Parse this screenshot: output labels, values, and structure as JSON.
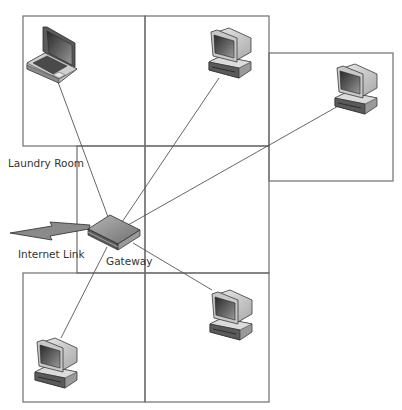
{
  "diagram": {
    "type": "home network floor plan",
    "labels": {
      "laundry_room": "Laundry Room",
      "internet_link": "Internet Link",
      "gateway": "Gateway"
    },
    "devices": [
      {
        "id": "laptop",
        "kind": "laptop",
        "room": "top-left"
      },
      {
        "id": "pc-top-center",
        "kind": "desktop",
        "room": "top-center"
      },
      {
        "id": "pc-right",
        "kind": "desktop",
        "room": "right"
      },
      {
        "id": "pc-bottom-left",
        "kind": "desktop",
        "room": "bottom-left"
      },
      {
        "id": "pc-bottom-right",
        "kind": "desktop",
        "room": "bottom-right"
      },
      {
        "id": "gateway",
        "kind": "router",
        "room": "laundry-room"
      }
    ],
    "connections": [
      {
        "from": "gateway",
        "to": "laptop"
      },
      {
        "from": "gateway",
        "to": "pc-top-center"
      },
      {
        "from": "gateway",
        "to": "pc-right"
      },
      {
        "from": "gateway",
        "to": "pc-bottom-left"
      },
      {
        "from": "gateway",
        "to": "pc-bottom-right"
      },
      {
        "from": "gateway",
        "to": "internet",
        "style": "lightning-bolt"
      }
    ],
    "colors": {
      "wall": "#6e6e6e",
      "link": "#555555",
      "device_dark": "#3a3a3a",
      "device_mid": "#8a8a8a",
      "device_light": "#d8d8d8"
    }
  }
}
